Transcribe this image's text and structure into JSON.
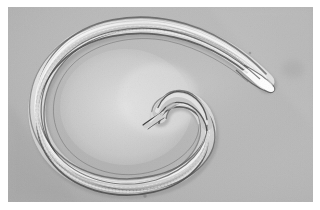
{
  "image": {
    "kind": "photomicrograph",
    "subject_name": "nematode-roundworm",
    "caption": "",
    "width_px": 320,
    "height_px": 210,
    "border": {
      "color": "#ffffff",
      "left_px": 8,
      "top_px": 7,
      "right_px": 7,
      "bottom_px": 8
    },
    "frame": {
      "x": 8,
      "y": 7,
      "width": 305,
      "height": 195
    },
    "background": {
      "base_color": "#b6b6b6",
      "highlight_color": "#e3e3e3",
      "shadow_color": "#a3a3a3",
      "inner_coil_color": "#e1e1e1"
    },
    "specimen": {
      "label": "coiled nematode",
      "cuticle_outline_color": "#3c3c3c",
      "body_fill_color": "#c9c9c9",
      "body_highlight_color": "#f4f4f4",
      "tail_tip_color": "#ffffff",
      "shape": "C-shaped coil",
      "head_end": "inner hooked tip, center of coil",
      "tail_end": "outer tapered bright tip, upper right"
    },
    "artifacts": [
      {
        "name": "debris-speck-bottom",
        "x": 145,
        "y": 196,
        "r": 1.6,
        "color": "#8a8a8a"
      },
      {
        "name": "debris-blob-right",
        "x": 293,
        "y": 68,
        "r": 9,
        "color": "#a8a8a8"
      },
      {
        "name": "debris-speck-upper",
        "x": 250,
        "y": 52,
        "r": 1.2,
        "color": "#909090"
      }
    ]
  }
}
